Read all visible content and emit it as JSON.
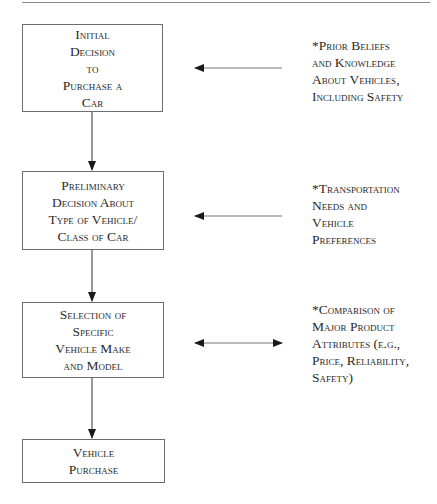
{
  "diagram": {
    "steps": [
      {
        "lines": [
          "Initial",
          "Decision",
          "to",
          "Purchase a",
          "Car"
        ]
      },
      {
        "lines": [
          "Preliminary",
          "Decision About",
          "Type of Vehicle/",
          "Class of Car"
        ]
      },
      {
        "lines": [
          "Selection of",
          "Specific",
          "Vehicle Make",
          "and Model"
        ]
      },
      {
        "lines": [
          "Vehicle",
          "Purchase"
        ]
      }
    ],
    "influences": [
      {
        "lines": [
          "*Prior Beliefs",
          "and Knowledge",
          "About Vehicles,",
          "Including Safety"
        ],
        "arrow": "left"
      },
      {
        "lines": [
          "*Transportation",
          "Needs and",
          "Vehicle",
          "Preferences"
        ],
        "arrow": "left"
      },
      {
        "lines": [
          "*Comparison of",
          "Major Product",
          "Attributes (e.g.,",
          "Price, Reliability,",
          "Safety)"
        ],
        "arrow": "both"
      }
    ]
  }
}
